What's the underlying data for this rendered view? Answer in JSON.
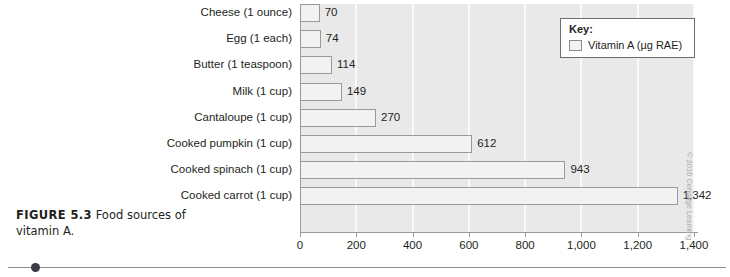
{
  "figure": {
    "number_label": "FIGURE 5.3",
    "caption_text": " Food sources of vitamin A.",
    "credit": "© 2016 Cengage Learning"
  },
  "legend": {
    "title": "Key:",
    "series_label": "Vitamin A (µg RAE)",
    "swatch_color": "#f2f2f2"
  },
  "chart_data": {
    "type": "bar",
    "orientation": "horizontal",
    "title": "Food sources of vitamin A.",
    "xlabel": "",
    "ylabel": "",
    "xlim": [
      0,
      1400
    ],
    "grid": true,
    "legend_position": "top-right",
    "categories": [
      "Cheese (1 ounce)",
      "Egg (1 each)",
      "Butter (1 teaspoon)",
      "Milk (1 cup)",
      "Cantaloupe (1 cup)",
      "Cooked pumpkin (1 cup)",
      "Cooked spinach (1 cup)",
      "Cooked carrot (1 cup)"
    ],
    "values": [
      70,
      74,
      114,
      149,
      270,
      612,
      943,
      1342
    ],
    "value_labels": [
      "70",
      "74",
      "114",
      "149",
      "270",
      "612",
      "943",
      "1,342"
    ],
    "series": [
      {
        "name": "Vitamin A (µg RAE)",
        "values": [
          70,
          74,
          114,
          149,
          270,
          612,
          943,
          1342
        ]
      }
    ],
    "xticks": [
      0,
      200,
      400,
      600,
      800,
      1000,
      1200,
      1400
    ],
    "xtick_labels": [
      "0",
      "200",
      "400",
      "600",
      "800",
      "1,000",
      "1,200",
      "1,400"
    ],
    "plot_background": "#e9e9e9",
    "bar_fill": "#f2f2f2",
    "bar_stroke": "#9a9a9a"
  }
}
